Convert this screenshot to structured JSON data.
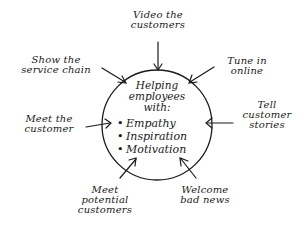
{
  "center": {
    "title": "Helping\nemployees\nwith:",
    "items": [
      "Empathy",
      "Inspiration",
      "Motivation"
    ]
  },
  "spokes": [
    {
      "id": "top",
      "label": "Video the\ncustomers"
    },
    {
      "id": "top-left",
      "label": "Show the\nservice chain"
    },
    {
      "id": "top-right",
      "label": "Tune in\nonline"
    },
    {
      "id": "left",
      "label": "Meet the\ncustomer"
    },
    {
      "id": "right",
      "label": "Tell\ncustomer\nstories"
    },
    {
      "id": "bottom-left",
      "label": "Meet\npotential\ncustomers"
    },
    {
      "id": "bottom-right",
      "label": "Welcome\nbad news"
    }
  ],
  "colors": {
    "ink": "#1a1a1a",
    "background": "#ffffff"
  }
}
